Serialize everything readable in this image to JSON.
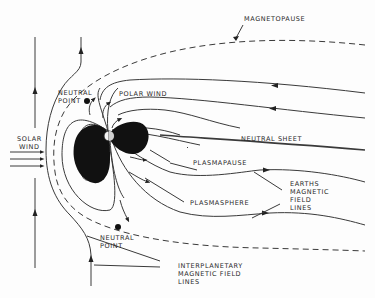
{
  "diagram": {
    "labels": {
      "magnetopause": "MAGNETOPAUSE",
      "neutral_point_top_1": "NEUTRAL",
      "neutral_point_top_2": "POINT",
      "polar_wind": "POLAR WIND",
      "solar_wind_1": "SOLAR",
      "solar_wind_2": "WIND",
      "neutral_sheet": "NEUTRAL SHEET",
      "plasmapause": "PLASMAPAUSE",
      "plasmasphere": "PLASMASPHERE",
      "earths_field_1": "EARTHS",
      "earths_field_2": "MAGNETIC",
      "earths_field_3": "FIELD",
      "earths_field_4": "LINES",
      "neutral_point_bottom_1": "NEUTRAL",
      "neutral_point_bottom_2": "POINT",
      "interplanetary_1": "INTERPLANETARY",
      "interplanetary_2": "MAGNETIC FIELD",
      "interplanetary_3": "LINES"
    },
    "colors": {
      "ink": "#111111",
      "background": "#fdfdfd"
    }
  }
}
